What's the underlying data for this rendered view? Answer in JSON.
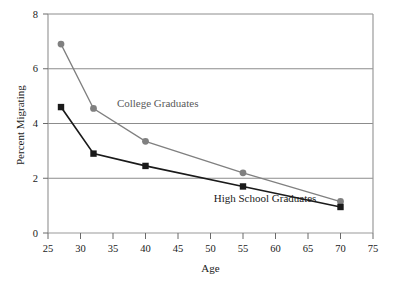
{
  "chart_data": {
    "type": "line",
    "title": "",
    "xlabel": "Age",
    "ylabel": "Percent Migrating",
    "xlim": [
      25,
      75
    ],
    "ylim": [
      0,
      8
    ],
    "xticks": [
      25,
      30,
      35,
      40,
      45,
      50,
      55,
      60,
      65,
      70,
      75
    ],
    "yticks": [
      0,
      2,
      4,
      6,
      8
    ],
    "grid": "horizontal",
    "legend_position": "inline-annotation",
    "x": [
      27,
      32,
      40,
      55,
      70
    ],
    "series": [
      {
        "name": "College Graduates",
        "color": "#808080",
        "marker": "circle",
        "values": [
          6.9,
          4.55,
          3.35,
          2.2,
          1.15
        ]
      },
      {
        "name": "High School Graduates",
        "color": "#1a1a1a",
        "marker": "square",
        "values": [
          4.6,
          2.9,
          2.45,
          1.7,
          0.95
        ]
      }
    ],
    "annotations": [
      {
        "text": "College Graduates",
        "x": 35.6,
        "y": 4.6,
        "color": "#595959"
      },
      {
        "text": "High School Graduates",
        "x": 50.5,
        "y": 1.15,
        "color": "#1a1a1a"
      }
    ]
  },
  "axes": {
    "x_tick_labels": [
      "25",
      "30",
      "35",
      "40",
      "45",
      "50",
      "55",
      "60",
      "65",
      "70",
      "75"
    ],
    "y_tick_labels": [
      "0",
      "2",
      "4",
      "6",
      "8"
    ],
    "x_title": "Age",
    "y_title": "Percent Migrating"
  },
  "colors": {
    "frame": "#9a9a9a",
    "gridline": "#8c8c8c",
    "college": "#808080",
    "highschool": "#1a1a1a",
    "background": "#ffffff"
  }
}
